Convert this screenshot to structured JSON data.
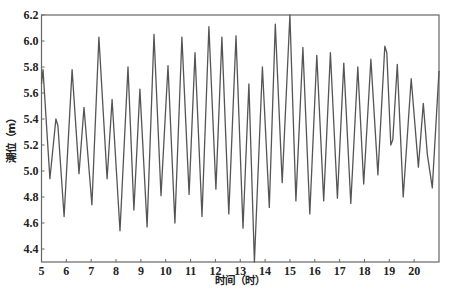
{
  "chart_data": {
    "type": "line",
    "title": "",
    "xlabel": "时间（时）",
    "ylabel": "潮位（m）",
    "xlim": [
      5,
      21
    ],
    "ylim": [
      4.3,
      6.2
    ],
    "grid": false,
    "legend": null,
    "xticks": [
      5,
      6,
      7,
      8,
      9,
      10,
      11,
      12,
      13,
      14,
      15,
      16,
      17,
      18,
      19,
      20
    ],
    "yticks": [
      4.4,
      4.6,
      4.8,
      5.0,
      5.2,
      5.4,
      5.6,
      5.8,
      6.0,
      6.2
    ],
    "ytick_labels": [
      "4.4",
      "4.6",
      "4.8",
      "5.0",
      "5.2",
      "5.4",
      "5.6",
      "5.8",
      "6.0",
      "6.2"
    ],
    "line_color": "#555555",
    "series": [
      {
        "name": "潮位",
        "x": [
          5.0,
          5.06,
          5.34,
          5.58,
          5.66,
          5.91,
          6.23,
          6.51,
          6.71,
          7.03,
          7.31,
          7.64,
          7.84,
          8.16,
          8.48,
          8.72,
          8.96,
          9.25,
          9.53,
          9.81,
          10.09,
          10.37,
          10.65,
          10.94,
          11.18,
          11.46,
          11.74,
          12.02,
          12.26,
          12.54,
          12.83,
          13.11,
          13.35,
          13.57,
          13.89,
          14.17,
          14.41,
          14.69,
          15.0,
          15.24,
          15.52,
          15.8,
          16.08,
          16.36,
          16.63,
          16.91,
          17.17,
          17.45,
          17.73,
          17.97,
          18.26,
          18.54,
          18.82,
          18.9,
          19.06,
          19.14,
          19.32,
          19.56,
          19.88,
          20.17,
          20.37,
          20.53,
          20.73,
          21.0
        ],
        "y": [
          5.67,
          5.78,
          4.94,
          5.4,
          5.35,
          4.65,
          5.78,
          4.98,
          5.49,
          4.74,
          6.03,
          4.94,
          5.55,
          4.54,
          5.8,
          4.7,
          5.63,
          4.57,
          6.05,
          4.81,
          5.81,
          4.6,
          6.03,
          4.82,
          5.91,
          4.65,
          6.11,
          4.86,
          6.03,
          4.67,
          6.04,
          4.56,
          5.67,
          4.3,
          5.8,
          4.72,
          6.13,
          4.91,
          6.2,
          4.77,
          5.95,
          4.67,
          5.89,
          4.77,
          5.91,
          4.79,
          5.83,
          4.75,
          5.8,
          4.9,
          5.86,
          4.97,
          5.96,
          5.91,
          5.2,
          5.24,
          5.82,
          4.8,
          5.71,
          5.03,
          5.52,
          5.13,
          4.87,
          5.77
        ]
      }
    ]
  }
}
